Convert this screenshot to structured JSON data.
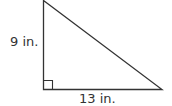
{
  "diagram": {
    "type": "right-triangle",
    "vertical_leg_label": "9 in.",
    "horizontal_leg_label": "13 in.",
    "right_angle_marker": true,
    "stroke_color": "#333333"
  }
}
